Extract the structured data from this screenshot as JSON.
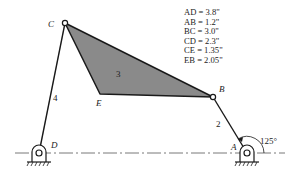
{
  "diagram": {
    "joints": {
      "A": {
        "label": "A",
        "x": 247,
        "y": 153
      },
      "B": {
        "label": "B",
        "x": 213,
        "y": 97
      },
      "C": {
        "label": "C",
        "x": 65,
        "y": 23
      },
      "D": {
        "label": "D",
        "x": 39,
        "y": 153
      },
      "E": {
        "label": "E",
        "x": 100,
        "y": 94
      }
    },
    "links": [
      {
        "id": "2",
        "label": "2",
        "from": "A",
        "to": "B"
      },
      {
        "id": "3",
        "label": "3",
        "type": "coupler",
        "points": [
          "C",
          "B",
          "E"
        ]
      },
      {
        "id": "4",
        "label": "4",
        "from": "D",
        "to": "C"
      }
    ],
    "angle": {
      "label": "125°",
      "at": "A"
    },
    "dimensions": [
      {
        "name": "AD",
        "value": "3.8\""
      },
      {
        "name": "AB",
        "value": "1.2\""
      },
      {
        "name": "BC",
        "value": "3.0\""
      },
      {
        "name": "CD",
        "value": "2.3\""
      },
      {
        "name": "CE",
        "value": "1.35\""
      },
      {
        "name": "EB",
        "value": "2.05\""
      }
    ],
    "colors": {
      "coupler_fill": "#8a8a8a",
      "line": "#1a1a1a"
    }
  },
  "text": {
    "dim0": "AD = 3.8\"",
    "dim1": "AB = 1.2\"",
    "dim2": "BC = 3.0\"",
    "dim3": "CD = 2.3\"",
    "dim4": "CE = 1.35\"",
    "dim5": "EB = 2.05\"",
    "label_A": "A",
    "label_B": "B",
    "label_C": "C",
    "label_D": "D",
    "label_E": "E",
    "link2": "2",
    "link3": "3",
    "link4": "4",
    "angle": "125°"
  }
}
